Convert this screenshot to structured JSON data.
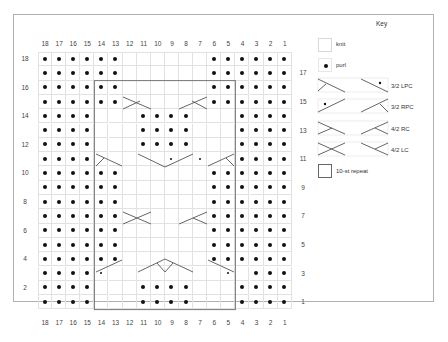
{
  "chart": {
    "columns": [
      "18",
      "17",
      "16",
      "15",
      "14",
      "13",
      "12",
      "11",
      "10",
      "9",
      "8",
      "7",
      "6",
      "5",
      "4",
      "3",
      "2",
      "1"
    ],
    "left_row_labels": [
      "18",
      "16",
      "14",
      "12",
      "10",
      "8",
      "6",
      "4",
      "2"
    ],
    "right_row_labels": [
      "17",
      "15",
      "13",
      "11",
      "9",
      "7",
      "5",
      "3",
      "1"
    ],
    "rows": {
      "18": "PPPPPP......PPPPPP",
      "17": "PPPPPP......PPPPPP",
      "16": "PPPPPP......PPPPPP",
      "15": "PPPPPP......PPPPPP",
      "14": "PPPP...PPPP...PPPP",
      "13": "PPPP...PPPP...PPPP",
      "12": "PPPP...PPPP...PPPP",
      "11": "PPPP.....s.s..PPPP",
      "10": "PPPPPP......PPPPPP",
      "9": "PPPPPP......PPPPPP",
      "8": "PPPPPP......PPPPPP",
      "7": "PPPPPP......PPPPPP",
      "6": "PPPPPP......PPPPPP",
      "5": "PPPPPP......PPPPPP",
      "4": "PPPPPP......PPPPPP",
      "3": "PPPPs........s.PPPP",
      "2": "PPPP...PPPP...PPPP",
      "1": "PPPP...PPPP...PPPP"
    },
    "repeat_box": {
      "from_col": 14,
      "to_col": 5,
      "from_row": 16,
      "to_row": 1
    }
  },
  "key": {
    "title": "Key",
    "items": [
      {
        "symbol": "knit-icon",
        "label": "knit"
      },
      {
        "symbol": "purl-icon",
        "label": "purl"
      },
      {
        "symbol": "lpc-3-2-icon",
        "label": "3/2 LPC"
      },
      {
        "symbol": "rpc-3-2-icon",
        "label": "3/2 RPC"
      },
      {
        "symbol": "rc-4-2-icon",
        "label": "4/2 RC"
      },
      {
        "symbol": "lc-4-2-icon",
        "label": "4/2 LC"
      },
      {
        "symbol": "repeat-box-icon",
        "label": "10-st repeat"
      }
    ]
  }
}
